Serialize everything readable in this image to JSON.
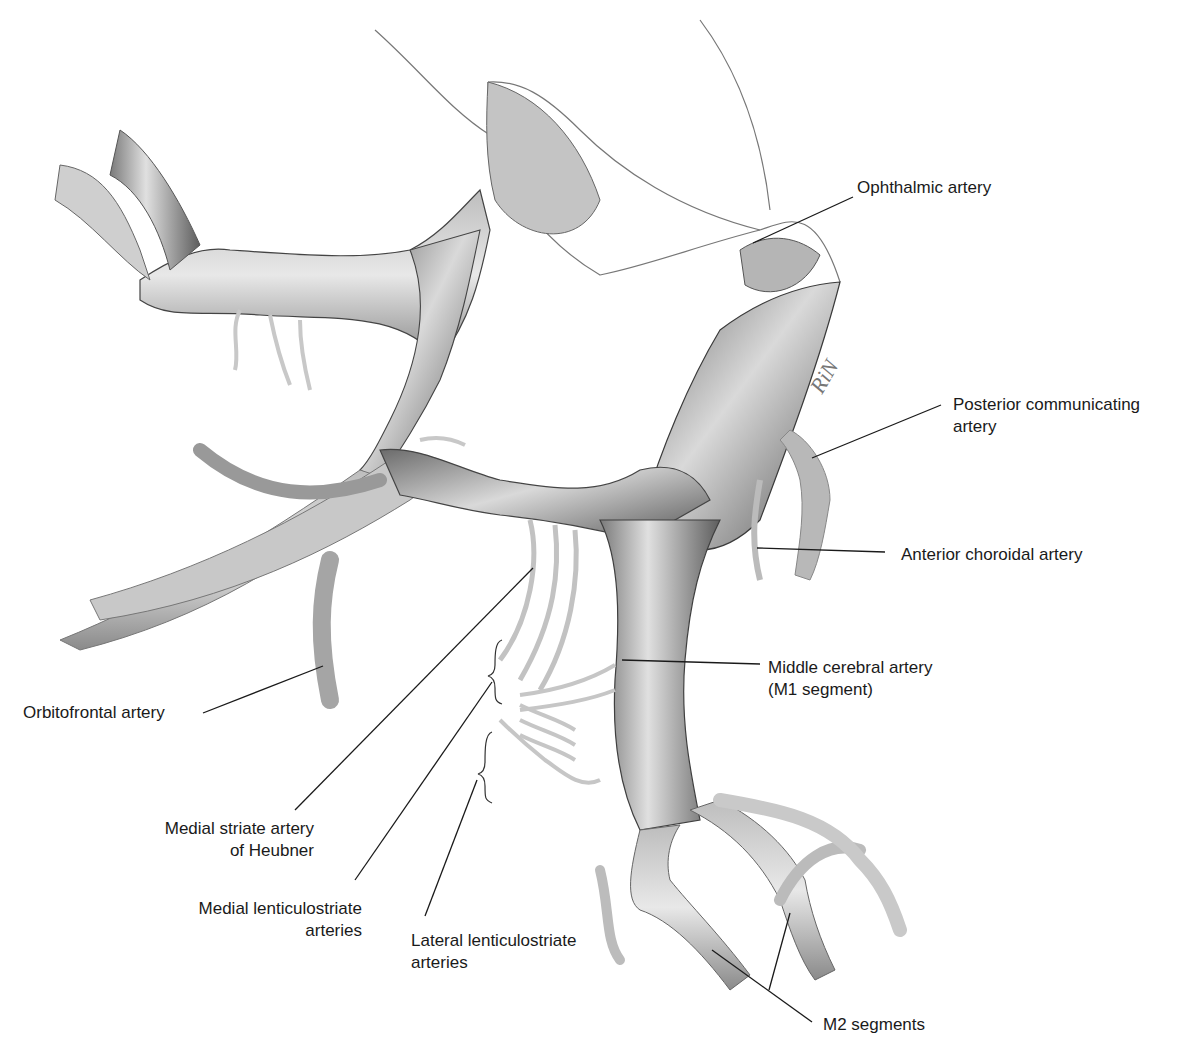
{
  "figure": {
    "signature": "RiN"
  },
  "labels": {
    "ophthalmic": "Ophthalmic artery",
    "pcom_line1": "Posterior communicating",
    "pcom_line2": "artery",
    "ant_choroidal": "Anterior choroidal artery",
    "mca_line1": "Middle cerebral artery",
    "mca_line2": "(M1 segment)",
    "orbitofrontal": "Orbitofrontal artery",
    "heubner_line1": "Medial striate artery",
    "heubner_line2": "of Heubner",
    "medial_lent_line1": "Medial lenticulostriate",
    "medial_lent_line2": "arteries",
    "lateral_lent_line1": "Lateral lenticulostriate",
    "lateral_lent_line2": "arteries",
    "m2": "M2 segments"
  },
  "colors": {
    "vessel_dark": "#5a5a5a",
    "vessel_mid": "#9a9a9a",
    "vessel_light": "#e6e6e6",
    "leader_line": "#1a1a1a",
    "text": "#1a1a1a"
  }
}
